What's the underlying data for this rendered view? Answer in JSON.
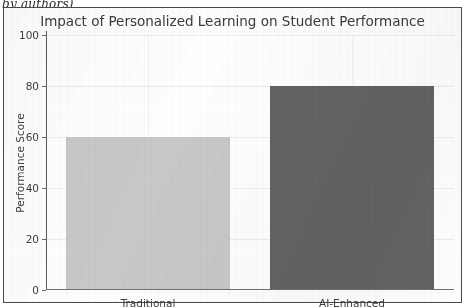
{
  "caption_fragment": "by authors)",
  "chart_data": {
    "type": "bar",
    "title": "Impact of Personalized Learning on Student Performance",
    "categories": [
      "Traditional",
      "AI-Enhanced"
    ],
    "values": [
      60,
      80
    ],
    "series": [
      {
        "name": "Performance Score",
        "values": [
          60,
          80
        ]
      }
    ],
    "xlabel": "",
    "ylabel": "Performance Score",
    "ylim": [
      0,
      100
    ],
    "yticks": [
      0,
      20,
      40,
      60,
      80,
      100
    ],
    "ytick_labels": [
      "0",
      "20",
      "40",
      "60",
      "80",
      "100"
    ],
    "grid": true,
    "legend": false,
    "bar_colors": [
      "#c8c8c8",
      "#636363"
    ],
    "frame_color": "#4a4a4a",
    "axis_color": "#5a5a5a",
    "text_color": "#3d3d3d"
  }
}
